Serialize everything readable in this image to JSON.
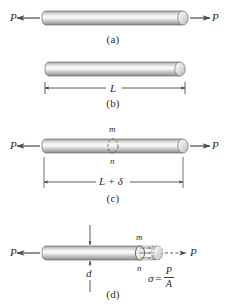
{
  "figure": {
    "colors": {
      "ink": "#2b2b2b",
      "line": "#3a3a3a",
      "bar_light": "#f2f2f2",
      "bar_mid": "#c9c9c9",
      "bar_dark": "#8e8e8e",
      "cap_fill": "#d8d8d8",
      "background": "#ffffff"
    }
  },
  "panels": [
    {
      "id": "a",
      "label": "(a)",
      "force_left": "P",
      "force_right": "P"
    },
    {
      "id": "b",
      "label": "(b)",
      "dimension": "L"
    },
    {
      "id": "c",
      "label": "(c)",
      "force_left": "P",
      "force_right": "P",
      "section_top": "m",
      "section_bottom": "n",
      "dimension": "L + δ"
    },
    {
      "id": "d",
      "label": "(d)",
      "force_left": "P",
      "force_right": "P",
      "section_top": "m",
      "section_bottom": "n",
      "diameter": "d",
      "stress_symbol": "σ",
      "equals": "=",
      "stress_numerator": "P",
      "stress_denominator": "A"
    }
  ]
}
